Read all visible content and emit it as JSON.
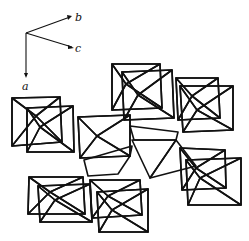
{
  "figure": {
    "type": "crystal-structure-polyhedra",
    "axes": {
      "origin": [
        26,
        33
      ],
      "labels": [
        {
          "name": "a",
          "text": "a",
          "tip": [
            26,
            76
          ],
          "label_pos": [
            25,
            90
          ]
        },
        {
          "name": "b",
          "text": "b",
          "tip": [
            70,
            17
          ],
          "label_pos": [
            76,
            19
          ]
        },
        {
          "name": "c",
          "text": "c",
          "tip": [
            73,
            48
          ],
          "label_pos": [
            76,
            52
          ]
        }
      ]
    },
    "colors": {
      "ink": "#111111",
      "paper": "#ffffff",
      "stipple_light": "#d9d9d9",
      "stipple_dense": "#b5b5b5"
    },
    "octahedra": [
      {
        "id": "oct-top-left-back",
        "quad": [
          [
            12,
            98
          ],
          [
            60,
            97
          ],
          [
            62,
            142
          ],
          [
            12,
            146
          ]
        ],
        "center": [
          36,
          116
        ]
      },
      {
        "id": "oct-top-left-front",
        "quad": [
          [
            27,
            108
          ],
          [
            73,
            106
          ],
          [
            74,
            152
          ],
          [
            27,
            152
          ]
        ],
        "center": [
          40,
          127
        ]
      },
      {
        "id": "oct-mid-left",
        "quad": [
          [
            78,
            117
          ],
          [
            130,
            115
          ],
          [
            130,
            156
          ],
          [
            80,
            158
          ]
        ],
        "center": [
          97,
          136
        ]
      },
      {
        "id": "oct-top-center-back",
        "quad": [
          [
            112,
            64
          ],
          [
            160,
            64
          ],
          [
            162,
            108
          ],
          [
            112,
            110
          ]
        ],
        "center": [
          126,
          84
        ]
      },
      {
        "id": "oct-top-center",
        "quad": [
          [
            122,
            72
          ],
          [
            172,
            70
          ],
          [
            174,
            118
          ],
          [
            124,
            120
          ]
        ],
        "center": [
          138,
          95
        ]
      },
      {
        "id": "oct-top-right-back",
        "quad": [
          [
            176,
            78
          ],
          [
            218,
            78
          ],
          [
            220,
            118
          ],
          [
            178,
            120
          ]
        ],
        "center": [
          192,
          96
        ]
      },
      {
        "id": "oct-top-right",
        "quad": [
          [
            180,
            86
          ],
          [
            233,
            86
          ],
          [
            233,
            130
          ],
          [
            183,
            132
          ]
        ],
        "center": [
          197,
          110
        ]
      },
      {
        "id": "oct-right-back",
        "quad": [
          [
            180,
            148
          ],
          [
            225,
            150
          ],
          [
            226,
            188
          ],
          [
            182,
            190
          ]
        ],
        "center": [
          196,
          168
        ]
      },
      {
        "id": "oct-right-front",
        "quad": [
          [
            186,
            160
          ],
          [
            241,
            158
          ],
          [
            241,
            205
          ],
          [
            188,
            205
          ]
        ],
        "center": [
          200,
          178
        ]
      },
      {
        "id": "oct-bottom-left-back",
        "quad": [
          [
            29,
            177
          ],
          [
            83,
            177
          ],
          [
            85,
            214
          ],
          [
            28,
            214
          ]
        ],
        "center": [
          50,
          192
        ]
      },
      {
        "id": "oct-bottom-left",
        "quad": [
          [
            38,
            186
          ],
          [
            90,
            184
          ],
          [
            92,
            222
          ],
          [
            40,
            222
          ]
        ],
        "center": [
          55,
          200
        ]
      },
      {
        "id": "oct-bottom-center-back",
        "quad": [
          [
            90,
            180
          ],
          [
            140,
            180
          ],
          [
            142,
            215
          ],
          [
            92,
            218
          ]
        ],
        "center": [
          108,
          196
        ]
      },
      {
        "id": "oct-bottom-center",
        "quad": [
          [
            97,
            192
          ],
          [
            148,
            189
          ],
          [
            148,
            232
          ],
          [
            99,
            232
          ]
        ],
        "center": [
          112,
          210
        ]
      }
    ],
    "highlighted_octahedron": {
      "id": "oct-central-hatched",
      "top_edge": [
        [
          130,
          127
        ],
        [
          178,
          133
        ]
      ],
      "left_triangle": [
        [
          85,
          163
        ],
        [
          130,
          150
        ],
        [
          118,
          172
        ]
      ],
      "center_triangle": [
        [
          132,
          131
        ],
        [
          178,
          134
        ],
        [
          150,
          178
        ]
      ],
      "right_triangle": [
        [
          178,
          134
        ],
        [
          195,
          166
        ],
        [
          150,
          178
        ]
      ]
    }
  }
}
